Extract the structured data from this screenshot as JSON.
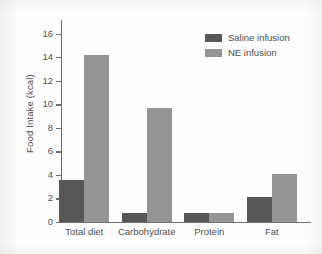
{
  "chart_data": {
    "type": "bar",
    "title": "",
    "xlabel": "",
    "ylabel": "Food Intake (kcal)",
    "ylim": [
      0,
      17
    ],
    "yticks": [
      0,
      2,
      4,
      6,
      8,
      10,
      12,
      14,
      16
    ],
    "ytick_labels": [
      "0",
      "2",
      "4",
      "6",
      "8",
      "10",
      "12",
      "14",
      "16"
    ],
    "grid": false,
    "legend_position": "top-right",
    "categories": [
      "Total diet",
      "Carbohydrate",
      "Protein",
      "Fat"
    ],
    "series": [
      {
        "name": "Saline infusion",
        "color": "#575757",
        "values": [
          3.6,
          0.8,
          0.8,
          2.1
        ]
      },
      {
        "name": "NE infusion",
        "color": "#949494",
        "values": [
          14.2,
          9.7,
          0.8,
          4.1
        ]
      }
    ]
  },
  "legend": {
    "entries": [
      {
        "label": "Saline infusion",
        "swatch": "#575757"
      },
      {
        "label": "NE infusion",
        "swatch": "#949494"
      }
    ]
  },
  "axes": {
    "y_title": "Food Intake (kcal)",
    "axis_color": "#707070",
    "text_color": "#4f4f4f"
  }
}
